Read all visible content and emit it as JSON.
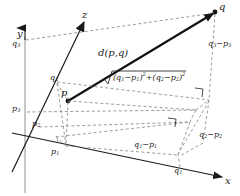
{
  "figure": {
    "type": "3d-euclidean-distance-diagram",
    "background": "#ffffff",
    "ink": "#1a1a1a",
    "dash_color": "#8a8a8a"
  },
  "axes": {
    "x_label": "x",
    "y_label": "y",
    "z_label": "z"
  },
  "points": {
    "p_label": "p",
    "q_label": "q"
  },
  "labels": {
    "q3_on_y_axis": "q",
    "q3_on_y_axis_sub": "3",
    "p3_on_y_axis": "p",
    "p3_on_y_axis_sub": "3",
    "q2_on_z_axis": "q",
    "q2_on_z_axis_sub": "2",
    "p2_on_z_axis": "p",
    "p2_on_z_axis_sub": "2",
    "p1_on_x_axis": "p",
    "p1_on_x_axis_sub": "1",
    "q1_on_x_axis": "q",
    "q1_on_x_axis_sub": "1",
    "distance": "d(p,q)",
    "delta_x_base": "q",
    "delta_x_base_sub": "1",
    "delta_x_minus": "−p",
    "delta_x_minus_sub": "1",
    "delta_z_base": "q",
    "delta_z_base_sub": "2",
    "delta_z_minus": "−p",
    "delta_z_minus_sub": "2",
    "delta_y_base": "q",
    "delta_y_base_sub": "3",
    "delta_y_minus": "−p",
    "delta_y_minus_sub": "3",
    "radicand": "(q₁−p₁)²+(q₂−p₂)²",
    "radical_sign": "√"
  },
  "formula_parts": {
    "open1": "(q",
    "sub1a": "1",
    "mid1": "−p",
    "sub1b": "1",
    "close1": ")",
    "sup1": "2",
    "plus": "+",
    "open2": "(q",
    "sub2a": "2",
    "mid2": "−p",
    "sub2b": "2",
    "close2": ")",
    "sup2": "2"
  },
  "markers": {
    "right_angle_upper": "right-angle",
    "right_angle_lower": "right-angle"
  }
}
